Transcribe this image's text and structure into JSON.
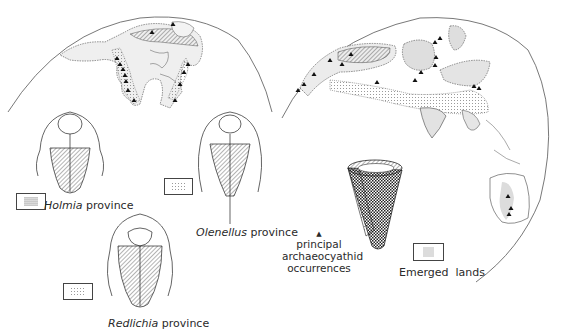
{
  "figure": {
    "title": "",
    "provinces": [
      {
        "id": "holmia",
        "genus": "Holmia",
        "suffix": "province",
        "legend_pattern": "dense-dots"
      },
      {
        "id": "olenellus",
        "genus": "Olenellus",
        "suffix": "province",
        "legend_pattern": "light-dots"
      },
      {
        "id": "redlichia",
        "genus": "Redlichia",
        "suffix": "province",
        "legend_pattern": "medium-dots"
      }
    ],
    "legend": {
      "archaeocyathid": {
        "symbol": "▲",
        "line1": "principal",
        "line2": "archaeocyathid",
        "line3": "occurrences"
      },
      "emerged_lands": {
        "label_word1": "Emerged",
        "label_word2": "lands"
      }
    },
    "maps": [
      {
        "id": "west-hemisphere",
        "region": "North America"
      },
      {
        "id": "east-hemisphere",
        "region": "Eurasia, Asia, Australia"
      }
    ],
    "colors": {
      "ink": "#222222",
      "land_fill": "#d9d9d9",
      "background": "#ffffff"
    }
  }
}
